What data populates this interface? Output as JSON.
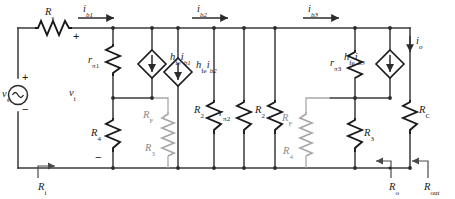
{
  "figure": {
    "type": "circuit-diagram",
    "colors": {
      "wire": "#3a3a3a",
      "component": "#1a1a1a",
      "feedback_resistor": "#a8a8a8",
      "background": "#ffffff"
    }
  },
  "source": {
    "name": "v_s",
    "symbol": "v",
    "subscript": "s",
    "type": "independent-voltage-source",
    "plus": "+",
    "minus": "−"
  },
  "input": {
    "series_resistor": {
      "symbol": "R",
      "subscript": "s"
    },
    "input_voltage": {
      "symbol": "v",
      "subscript": "i"
    },
    "input_resistance": {
      "symbol": "R",
      "subscript": "i"
    },
    "plus": "+",
    "minus": "−"
  },
  "currents": [
    {
      "symbol": "i",
      "subscript": "b1",
      "direction": "right"
    },
    {
      "symbol": "i",
      "subscript": "b2",
      "direction": "right"
    },
    {
      "symbol": "i",
      "subscript": "b3",
      "direction": "right"
    },
    {
      "symbol": "i",
      "subscript": "o",
      "direction": "down"
    }
  ],
  "dependent_sources": [
    {
      "gain": "h",
      "gain_sub": "fe",
      "current": "i",
      "current_sub": "b1",
      "type": "current-source",
      "arrow": "down"
    },
    {
      "gain": "h",
      "gain_sub": "fe",
      "current": "i",
      "current_sub": "b2",
      "type": "current-source",
      "arrow": "down"
    },
    {
      "gain": "h",
      "gain_sub": "fe",
      "current": "i",
      "current_sub": "b3",
      "type": "current-source",
      "arrow": "down"
    }
  ],
  "resistors": [
    {
      "symbol": "r",
      "subscript": "π1",
      "style": "black",
      "stage": 1
    },
    {
      "symbol": "R",
      "subscript": "4",
      "style": "black",
      "stage": 1
    },
    {
      "symbol": "R",
      "subscript": "F",
      "style": "gray",
      "stage": 1
    },
    {
      "symbol": "R",
      "subscript": "3",
      "style": "gray",
      "stage": 1
    },
    {
      "symbol": "R",
      "subscript": "2",
      "style": "black",
      "stage": 2
    },
    {
      "symbol": "r",
      "subscript": "π2",
      "style": "black",
      "stage": 2
    },
    {
      "symbol": "R",
      "subscript": "2",
      "style": "black",
      "stage": 3
    },
    {
      "symbol": "R",
      "subscript": "F",
      "style": "gray",
      "stage": 3
    },
    {
      "symbol": "R",
      "subscript": "4",
      "style": "gray",
      "stage": 3
    },
    {
      "symbol": "r",
      "subscript": "π3",
      "style": "black",
      "stage": 3
    },
    {
      "symbol": "R",
      "subscript": "3",
      "style": "black",
      "stage": 3
    },
    {
      "symbol": "R",
      "subscript": "C",
      "style": "black",
      "stage": 3
    }
  ],
  "outputs": [
    {
      "symbol": "R",
      "subscript": "o",
      "direction": "left"
    },
    {
      "symbol": "R",
      "subscript": "out",
      "direction": "left"
    }
  ],
  "labels": {
    "Rs": {
      "main": "R",
      "sub": "s"
    },
    "ib1": {
      "main": "i",
      "sub": "b1"
    },
    "ib2": {
      "main": "i",
      "sub": "b2"
    },
    "ib3": {
      "main": "i",
      "sub": "b3"
    },
    "io": {
      "main": "i",
      "sub": "o"
    },
    "rpi1": {
      "main": "r",
      "sub": "π1"
    },
    "rpi2": {
      "main": "r",
      "sub": "π2"
    },
    "rpi3": {
      "main": "r",
      "sub": "π3"
    },
    "hfe1": {
      "main": "h",
      "sub": "fe",
      "main2": "i",
      "sub2": "b1"
    },
    "hfe2": {
      "main": "h",
      "sub": "fe",
      "main2": "i",
      "sub2": "b2"
    },
    "hfe3": {
      "main": "h",
      "sub": "fe",
      "main2": "i",
      "sub2": "b3"
    },
    "vs": {
      "main": "v",
      "sub": "s"
    },
    "vi": {
      "main": "v",
      "sub": "i"
    },
    "Ri": {
      "main": "R",
      "sub": "i"
    },
    "R4a": {
      "main": "R",
      "sub": "4"
    },
    "RFa": {
      "main": "R",
      "sub": "F"
    },
    "R3a": {
      "main": "R",
      "sub": "3"
    },
    "R2a": {
      "main": "R",
      "sub": "2"
    },
    "R2b": {
      "main": "R",
      "sub": "2"
    },
    "RFb": {
      "main": "R",
      "sub": "F"
    },
    "R4b": {
      "main": "R",
      "sub": "4"
    },
    "R3b": {
      "main": "R",
      "sub": "3"
    },
    "RC": {
      "main": "R",
      "sub": "C"
    },
    "Ro": {
      "main": "R",
      "sub": "o"
    },
    "Rout": {
      "main": "R",
      "sub": "out"
    },
    "plus1": "+",
    "plus2": "+",
    "minus1": "−",
    "minus2": "−"
  }
}
